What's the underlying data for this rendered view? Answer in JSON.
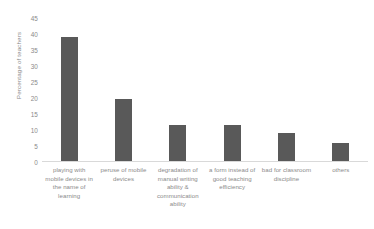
{
  "chart_data": {
    "type": "bar",
    "title": "",
    "xlabel": "",
    "ylabel": "Percentage of teachers",
    "ylim": [
      0,
      45
    ],
    "ytick_step": 5,
    "yticks": [
      45,
      40,
      35,
      30,
      25,
      20,
      15,
      10,
      5,
      0
    ],
    "grid": false,
    "legend": "none",
    "bar_color": "#595959",
    "axis_text_color": "#8a8a8a",
    "baseline_color": "#d9d9d9",
    "categories": [
      "playing with mobile devices in the name of learning",
      "peruse of mobile devices",
      "degradation of manual writing ability & communication ability",
      "a form instead of good teaching efficiency",
      "bad for classroom discipline",
      "others"
    ],
    "values": [
      39,
      19.8,
      11.5,
      11.5,
      9.2,
      6
    ]
  }
}
